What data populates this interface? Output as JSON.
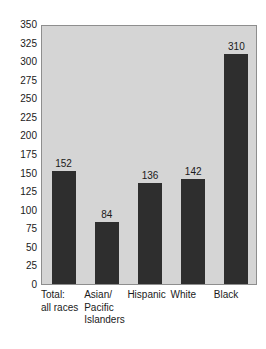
{
  "chart_data": {
    "type": "bar",
    "title": "",
    "subtitle": "",
    "xlabel": "",
    "ylabel": "",
    "categories": [
      "Total: all races",
      "Asian/ Pacific Islanders",
      "Hispanic",
      "White",
      "Black"
    ],
    "category_lines": [
      [
        "Total:",
        "all races"
      ],
      [
        "Asian/",
        "Pacific",
        "Islanders"
      ],
      [
        "Hispanic"
      ],
      [
        "White"
      ],
      [
        "Black"
      ]
    ],
    "values": [
      152,
      84,
      136,
      142,
      310
    ],
    "value_labels": [
      "152",
      "84",
      "136",
      "142",
      "310"
    ],
    "ylim": [
      0,
      350
    ],
    "ytick_values": [
      0,
      25,
      50,
      75,
      100,
      125,
      150,
      175,
      200,
      225,
      250,
      275,
      300,
      325,
      350
    ],
    "ytick_labels": [
      "0",
      "25",
      "50",
      "75",
      "100",
      "125",
      "150",
      "175",
      "200",
      "225",
      "250",
      "275",
      "300",
      "325",
      "350"
    ],
    "grid": false,
    "legend": false,
    "legend_position": "none",
    "colors": {
      "bar_fill": "#2e2e2e",
      "plot_background": "#d5d5d5",
      "plot_border": "#8e8e8e",
      "page_background": "#ffffff",
      "text": "#1a1a1a"
    }
  }
}
